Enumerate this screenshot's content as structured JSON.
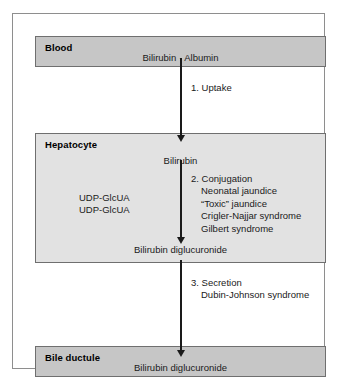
{
  "figure": {
    "compartments": [
      {
        "id": "blood",
        "title": "Blood",
        "species": "Bilirubin · Albumin",
        "shade": "#c6c6c6"
      },
      {
        "id": "hepatocyte",
        "title": "Hepatocyte",
        "species_in": "Bilirubin",
        "species_out": "Bilirubin diglucuronide",
        "shade": "#e2e2e2"
      },
      {
        "id": "bile_ductule",
        "title": "Bile ductule",
        "species": "Bilirubin diglucuronide",
        "shade": "#c6c6c6"
      }
    ],
    "steps": [
      {
        "id": "uptake",
        "heading": "1. Uptake",
        "disorders": []
      },
      {
        "id": "conjugation",
        "heading": "2. Conjugation",
        "disorders": [
          "Neonatal jaundice",
          "“Toxic” jaundice",
          "Crigler-Najjar syndrome",
          "Gilbert syndrome"
        ]
      },
      {
        "id": "secretion",
        "heading": "3. Secretion",
        "disorders": [
          "Dubin-Johnson syndrome"
        ]
      }
    ],
    "cofactors": [
      "UDP-GlcUA",
      "UDP-GlcUA"
    ],
    "colors": {
      "frame_border": "#8e8e8e",
      "box_border": "#6f6f6f",
      "arrow": "#1a1a1a",
      "text": "#1a1a1a",
      "background": "#ffffff"
    }
  }
}
